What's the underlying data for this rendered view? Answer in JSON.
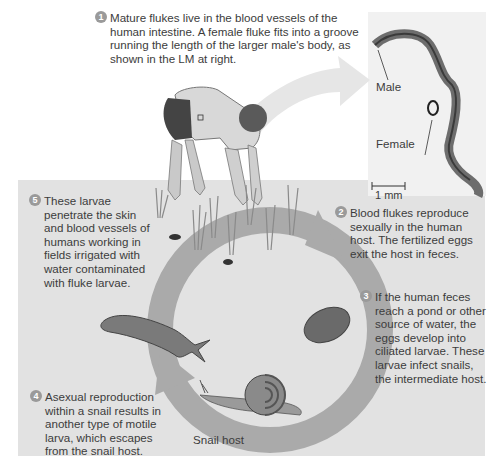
{
  "steps": [
    {
      "number": "1",
      "text": "Mature flukes live in the blood vessels of the human intestine. A female fluke fits into a groove running the length of the larger male's body, as shown in the LM at right."
    },
    {
      "number": "2",
      "text": "Blood flukes reproduce sexually in the human host. The fertilized eggs exit the host in feces."
    },
    {
      "number": "3",
      "text": "If the human feces reach a pond or other source of water, the eggs develop into ciliated larvae. These larvae infect snails, the intermediate host."
    },
    {
      "number": "4",
      "text": "Asexual reproduction within a snail results in another type of motile larva, which escapes from the snail host."
    },
    {
      "number": "5",
      "text": "These larvae penetrate the skin and blood vessels of humans working in fields irrigated with water contaminated with fluke larvae."
    }
  ],
  "micrograph": {
    "male_label": "Male",
    "female_label": "Female",
    "scale_bar": "1 mm"
  },
  "labels": {
    "snail_host": "Snail host"
  },
  "colors": {
    "panel_bg": "#e2e2e2",
    "cycle_arrow": "#a9a9a9",
    "step_badge": "#9a9a9a"
  }
}
